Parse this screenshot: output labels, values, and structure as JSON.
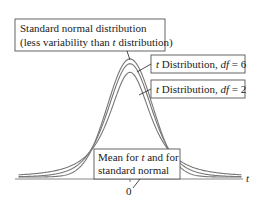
{
  "chart_data": {
    "type": "line",
    "title": "",
    "xlabel": "t",
    "ylabel": "",
    "xlim": [
      -5,
      5
    ],
    "ylim": [
      0,
      0.4
    ],
    "grid": false,
    "x_ticks": [
      {
        "value": 0,
        "label": "0"
      }
    ],
    "series": [
      {
        "name": "Standard normal distribution",
        "kind": "normal",
        "df": null,
        "peak_density": 0.399
      },
      {
        "name": "t Distribution, df = 6",
        "kind": "t",
        "df": 6,
        "peak_density": 0.383
      },
      {
        "name": "t Distribution, df = 2",
        "kind": "t",
        "df": 2,
        "peak_density": 0.354
      }
    ],
    "annotations": [
      {
        "id": "normal",
        "lines": [
          "Standard normal distribution",
          "(less variability than |t| distribution)"
        ],
        "points_to": "normal"
      },
      {
        "id": "df6",
        "lines": [
          "|t| Distribution, |df| = 6"
        ],
        "points_to": "df6"
      },
      {
        "id": "df2",
        "lines": [
          "|t| Distribution, |df| = 2"
        ],
        "points_to": "df2"
      },
      {
        "id": "mean",
        "lines": [
          "Mean for |t| and for",
          "standard normal"
        ],
        "points_to": "zero"
      }
    ]
  },
  "labels": {
    "normal_line1": "Standard normal distribution",
    "normal_line2_a": "(less variability than ",
    "normal_line2_t": "t",
    "normal_line2_b": " distribution)",
    "df6_t": "t",
    "df6_a": " Distribution, ",
    "df6_df": "df",
    "df6_b": " = 6",
    "df2_t": "t",
    "df2_a": " Distribution, ",
    "df2_df": "df",
    "df2_b": " = 2",
    "mean_line1_a": "Mean for ",
    "mean_line1_t": "t",
    "mean_line1_b": " and for",
    "mean_line2": "standard normal",
    "axis_t": "t",
    "tick_zero": "0"
  }
}
